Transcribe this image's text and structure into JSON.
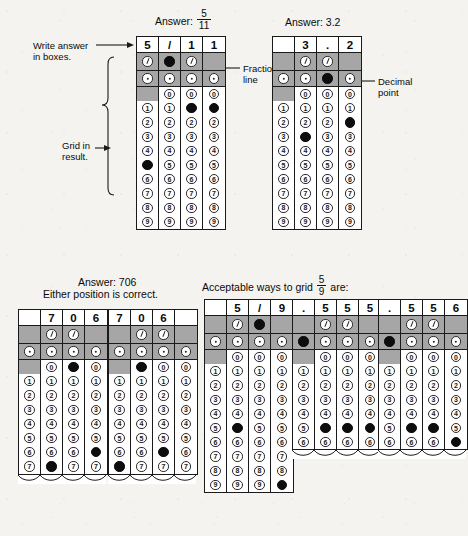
{
  "page": {
    "bubble_digits": [
      "0",
      "1",
      "2",
      "3",
      "4",
      "5",
      "6",
      "7",
      "8",
      "9"
    ]
  },
  "annotations": {
    "write_answer": "Write answer",
    "in_boxes": "in boxes.",
    "grid_in": "Grid in",
    "result": "result.",
    "fraction": "Fraction",
    "line": "line",
    "decimal": "Decimal",
    "point": "point"
  },
  "examples": [
    {
      "id": "answer-5-11",
      "caption_prefix": "Answer:",
      "caption_fraction": {
        "numerator": "5",
        "denominator": "11"
      },
      "caption_suffix": "",
      "columns": [
        {
          "written": "5",
          "symbol": "slash-empty",
          "dot": "dot-empty",
          "zero": "blank",
          "filled": "5"
        },
        {
          "written": "/",
          "symbol": "slash-filled",
          "dot": "dot-empty",
          "zero": "zero-empty",
          "filled": null
        },
        {
          "written": "1",
          "symbol": "slash-empty",
          "dot": "dot-empty",
          "zero": "zero-empty",
          "filled": "1"
        },
        {
          "written": "1",
          "symbol": "blank",
          "dot": "dot-empty",
          "zero": "zero-empty",
          "filled": "1"
        }
      ],
      "digits_to": "9",
      "truncated": false
    },
    {
      "id": "answer-3-2",
      "caption_prefix": "Answer: 3.2",
      "caption_fraction": null,
      "columns": [
        {
          "written": "",
          "symbol": "blank",
          "dot": "dot-empty",
          "zero": "blank",
          "filled": null
        },
        {
          "written": "3",
          "symbol": "slash-empty",
          "dot": "dot-empty",
          "zero": "zero-empty",
          "filled": "3"
        },
        {
          "written": ".",
          "symbol": "slash-empty",
          "dot": "dot-filled",
          "zero": "zero-empty",
          "filled": null
        },
        {
          "written": "2",
          "symbol": "blank",
          "dot": "dot-empty",
          "zero": "zero-empty",
          "filled": "2"
        }
      ],
      "digits_to": "9",
      "truncated": false
    },
    {
      "id": "answer-706-a",
      "caption_prefix": "Answer: 706",
      "caption_line2": "Either position is correct.",
      "caption_fraction": null,
      "columns": [
        {
          "written": "",
          "symbol": "blank",
          "dot": "dot-empty",
          "zero": "blank",
          "filled": null
        },
        {
          "written": "7",
          "symbol": "slash-empty",
          "dot": "dot-empty",
          "zero": "zero-empty",
          "filled": "7"
        },
        {
          "written": "0",
          "symbol": "slash-empty",
          "dot": "dot-empty",
          "zero": "zero-filled",
          "filled": null
        },
        {
          "written": "6",
          "symbol": "blank",
          "dot": "dot-empty",
          "zero": "zero-empty",
          "filled": "6"
        }
      ],
      "digits_to": "7",
      "truncated": true
    },
    {
      "id": "answer-706-b",
      "caption_prefix": "",
      "caption_fraction": null,
      "columns": [
        {
          "written": "7",
          "symbol": "blank",
          "dot": "dot-empty",
          "zero": "blank",
          "filled": "7"
        },
        {
          "written": "0",
          "symbol": "slash-empty",
          "dot": "dot-empty",
          "zero": "zero-filled",
          "filled": null
        },
        {
          "written": "6",
          "symbol": "slash-empty",
          "dot": "dot-empty",
          "zero": "zero-empty",
          "filled": "6"
        },
        {
          "written": "",
          "symbol": "blank",
          "dot": "dot-empty",
          "zero": "zero-empty",
          "filled": null
        }
      ],
      "digits_to": "7",
      "truncated": true
    },
    {
      "id": "grid-5-9-fraction",
      "caption_prefix": "Acceptable ways to grid",
      "caption_fraction": {
        "numerator": "5",
        "denominator": "9"
      },
      "caption_suffix": "are:",
      "columns": [
        {
          "written": "",
          "symbol": "blank",
          "dot": "dot-empty",
          "zero": "blank",
          "filled": null
        },
        {
          "written": "5",
          "symbol": "slash-empty",
          "dot": "dot-empty",
          "zero": "zero-empty",
          "filled": "5"
        },
        {
          "written": "/",
          "symbol": "slash-filled",
          "dot": "dot-empty",
          "zero": "zero-empty",
          "filled": null
        },
        {
          "written": "9",
          "symbol": "blank",
          "dot": "dot-empty",
          "zero": "zero-empty",
          "filled": "9"
        }
      ],
      "digits_to": "9",
      "truncated": false
    },
    {
      "id": "grid-555",
      "caption_prefix": "",
      "caption_fraction": null,
      "columns": [
        {
          "written": ".",
          "symbol": "blank",
          "dot": "dot-filled",
          "zero": "blank",
          "filled": null
        },
        {
          "written": "5",
          "symbol": "slash-empty",
          "dot": "dot-empty",
          "zero": "zero-empty",
          "filled": "5"
        },
        {
          "written": "5",
          "symbol": "slash-empty",
          "dot": "dot-empty",
          "zero": "zero-empty",
          "filled": "5"
        },
        {
          "written": "5",
          "symbol": "blank",
          "dot": "dot-empty",
          "zero": "zero-empty",
          "filled": "5"
        }
      ],
      "digits_to": "6",
      "truncated": true
    },
    {
      "id": "grid-556",
      "caption_prefix": "",
      "caption_fraction": null,
      "columns": [
        {
          "written": ".",
          "symbol": "blank",
          "dot": "dot-filled",
          "zero": "blank",
          "filled": null
        },
        {
          "written": "5",
          "symbol": "slash-empty",
          "dot": "dot-empty",
          "zero": "zero-empty",
          "filled": "5"
        },
        {
          "written": "5",
          "symbol": "slash-empty",
          "dot": "dot-empty",
          "zero": "zero-empty",
          "filled": "5"
        },
        {
          "written": "6",
          "symbol": "blank",
          "dot": "dot-empty",
          "zero": "zero-empty",
          "filled": "6"
        }
      ],
      "digits_to": "6",
      "truncated": true
    }
  ]
}
